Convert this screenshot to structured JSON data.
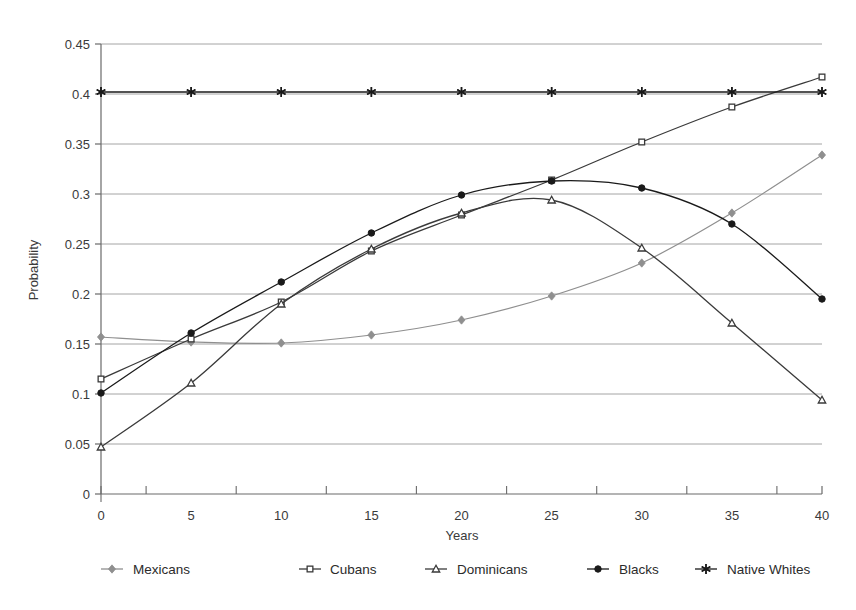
{
  "chart_data": {
    "type": "line",
    "title": "",
    "xlabel": "Years",
    "ylabel": "Probability",
    "x": [
      0,
      5,
      10,
      15,
      20,
      25,
      30,
      35,
      40
    ],
    "xlim": [
      0,
      40
    ],
    "ylim": [
      0,
      0.45
    ],
    "xticks": [
      "0",
      "5",
      "10",
      "15",
      "20",
      "25",
      "30",
      "35",
      "40"
    ],
    "yticks": [
      "0",
      "0.05",
      "0.1",
      "0.15",
      "0.2",
      "0.25",
      "0.3",
      "0.35",
      "0.4",
      "0.45"
    ],
    "ytick_values": [
      0,
      0.05,
      0.1,
      0.15,
      0.2,
      0.25,
      0.3,
      0.35,
      0.4,
      0.45
    ],
    "grid": "horizontal",
    "legend_position": "bottom",
    "series": [
      {
        "name": "Mexicans",
        "marker": "diamond",
        "color": "#8f8f8f",
        "values": [
          0.157,
          0.152,
          0.151,
          0.159,
          0.174,
          0.198,
          0.231,
          0.281,
          0.339
        ]
      },
      {
        "name": "Cubans",
        "marker": "open-square",
        "color": "#3a3a3a",
        "values": [
          0.115,
          0.155,
          0.192,
          0.243,
          0.279,
          0.314,
          0.352,
          0.387,
          0.417
        ]
      },
      {
        "name": "Dominicans",
        "marker": "open-triangle",
        "color": "#3a3a3a",
        "values": [
          0.047,
          0.111,
          0.19,
          0.245,
          0.281,
          0.294,
          0.246,
          0.171,
          0.094
        ]
      },
      {
        "name": "Blacks",
        "marker": "filled-circle",
        "color": "#1a1a1a",
        "values": [
          0.101,
          0.161,
          0.212,
          0.261,
          0.299,
          0.313,
          0.306,
          0.27,
          0.195
        ]
      },
      {
        "name": "Native Whites",
        "marker": "asterisk",
        "color": "#1a1a1a",
        "values": [
          0.402,
          0.402,
          0.402,
          0.402,
          0.402,
          0.402,
          0.402,
          0.402,
          0.402
        ]
      }
    ]
  },
  "legend": {
    "items": [
      {
        "label": "Mexicans"
      },
      {
        "label": "Cubans"
      },
      {
        "label": "Dominicans"
      },
      {
        "label": "Blacks"
      },
      {
        "label": "Native Whites"
      }
    ]
  },
  "axes": {
    "y_title": "Probability",
    "x_title": "Years"
  },
  "colors": {
    "grid": "#9a9a9a",
    "axis": "#6a6a6a",
    "text": "#2b2b2b",
    "mexicans": "#8f8f8f",
    "cubans": "#3a3a3a",
    "dominicans": "#3a3a3a",
    "blacks": "#1a1a1a",
    "native_whites": "#1a1a1a"
  }
}
